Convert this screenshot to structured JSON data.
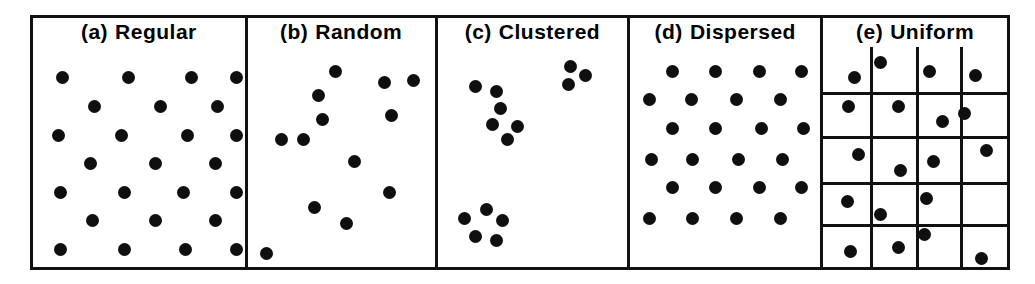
{
  "figure": {
    "kind": "spatial-point-pattern-panels",
    "background_color": "#ffffff",
    "ink_color": "#111111",
    "dot_color": "#100f0f",
    "dot_diameter_px": 13,
    "border_width_px": 3,
    "panels": [
      {
        "id": "a",
        "tag": "(a)",
        "label": "Regular",
        "pattern": "regular",
        "dot_count": 25,
        "points": [
          [
            14,
            14
          ],
          [
            45,
            14
          ],
          [
            75,
            14
          ],
          [
            96,
            14
          ],
          [
            29,
            27
          ],
          [
            60,
            27
          ],
          [
            87,
            27
          ],
          [
            12,
            40
          ],
          [
            42,
            40
          ],
          [
            73,
            40
          ],
          [
            96,
            40
          ],
          [
            27,
            53
          ],
          [
            58,
            53
          ],
          [
            86,
            53
          ],
          [
            13,
            66
          ],
          [
            43,
            66
          ],
          [
            71,
            66
          ],
          [
            96,
            66
          ],
          [
            28,
            79
          ],
          [
            58,
            79
          ],
          [
            86,
            79
          ],
          [
            13,
            92
          ],
          [
            43,
            92
          ],
          [
            72,
            92
          ],
          [
            96,
            92
          ]
        ]
      },
      {
        "id": "b",
        "tag": "(b)",
        "label": "Random",
        "pattern": "random",
        "dot_count": 13,
        "points": [
          [
            47,
            11
          ],
          [
            38,
            22
          ],
          [
            73,
            16
          ],
          [
            89,
            15
          ],
          [
            40,
            33
          ],
          [
            77,
            31
          ],
          [
            18,
            42
          ],
          [
            30,
            42
          ],
          [
            57,
            52
          ],
          [
            76,
            66
          ],
          [
            36,
            73
          ],
          [
            53,
            80
          ],
          [
            10,
            94
          ]
        ]
      },
      {
        "id": "c",
        "tag": "(c)",
        "label": "Clustered",
        "pattern": "clustered",
        "dot_count": 14,
        "clusters": 3,
        "points": [
          [
            70,
            9
          ],
          [
            78,
            13
          ],
          [
            69,
            17
          ],
          [
            20,
            18
          ],
          [
            31,
            20
          ],
          [
            33,
            28
          ],
          [
            29,
            35
          ],
          [
            42,
            36
          ],
          [
            37,
            42
          ],
          [
            14,
            78
          ],
          [
            26,
            74
          ],
          [
            34,
            79
          ],
          [
            20,
            86
          ],
          [
            31,
            88
          ]
        ]
      },
      {
        "id": "d",
        "tag": "(d)",
        "label": "Dispersed",
        "pattern": "dispersed",
        "dot_count": 24,
        "points": [
          [
            22,
            11
          ],
          [
            45,
            11
          ],
          [
            68,
            11
          ],
          [
            90,
            11
          ],
          [
            10,
            24
          ],
          [
            32,
            24
          ],
          [
            56,
            24
          ],
          [
            79,
            24
          ],
          [
            22,
            37
          ],
          [
            45,
            37
          ],
          [
            69,
            37
          ],
          [
            91,
            37
          ],
          [
            11,
            51
          ],
          [
            33,
            51
          ],
          [
            57,
            51
          ],
          [
            80,
            51
          ],
          [
            22,
            64
          ],
          [
            45,
            64
          ],
          [
            68,
            64
          ],
          [
            90,
            64
          ],
          [
            10,
            78
          ],
          [
            33,
            78
          ],
          [
            56,
            78
          ],
          [
            79,
            78
          ]
        ]
      },
      {
        "id": "e",
        "tag": "(e)",
        "label": "Uniform",
        "pattern": "uniform",
        "dot_count": 19,
        "grid": {
          "columns": 4,
          "rows": 5
        },
        "grid_v": [
          25.5,
          50.5,
          74.5
        ],
        "grid_h": [
          20.5,
          40.5,
          61.5,
          80.5
        ],
        "points": [
          [
            17,
            14
          ],
          [
            31,
            7
          ],
          [
            58,
            11
          ],
          [
            83,
            13
          ],
          [
            14,
            27
          ],
          [
            41,
            27
          ],
          [
            65,
            34
          ],
          [
            77,
            30
          ],
          [
            19,
            49
          ],
          [
            42,
            56
          ],
          [
            60,
            52
          ],
          [
            89,
            47
          ],
          [
            13,
            70
          ],
          [
            31,
            76
          ],
          [
            56,
            69
          ],
          [
            15,
            93
          ],
          [
            41,
            91
          ],
          [
            55,
            85
          ],
          [
            86,
            96
          ]
        ]
      }
    ]
  }
}
